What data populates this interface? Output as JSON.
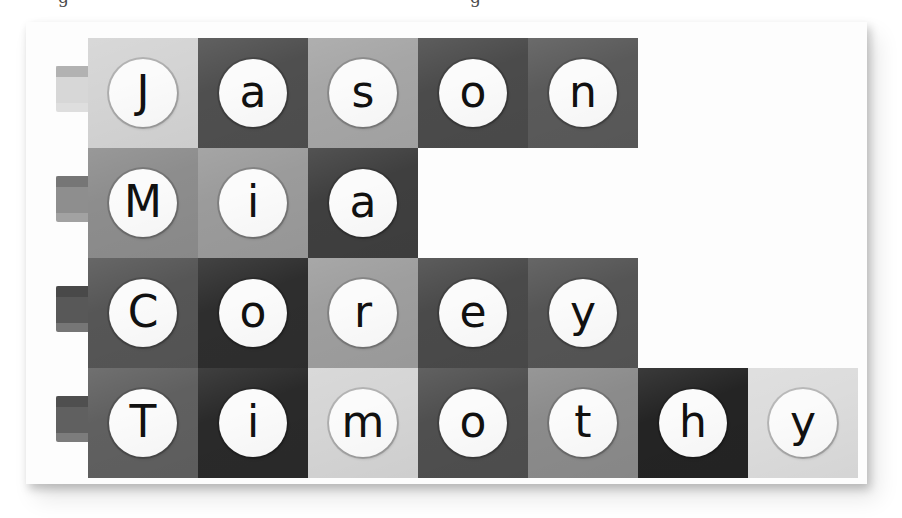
{
  "figure": {
    "card_background": "#fdfdfd",
    "page_background": "#ffffff",
    "disc_color": "#fbfbfb",
    "glyph_color": "#111111",
    "tile_size": 110,
    "columns_max": 7
  },
  "page_fragments": [
    {
      "text": "g",
      "left": 58
    },
    {
      "text": "g",
      "left": 470
    }
  ],
  "rows": [
    {
      "name": "Jason",
      "peg_color": "#d7d7d7",
      "tiles": [
        {
          "letter": "J",
          "color": "#d4d4d4"
        },
        {
          "letter": "a",
          "color": "#4f4f4f"
        },
        {
          "letter": "s",
          "color": "#a6a6a6"
        },
        {
          "letter": "o",
          "color": "#4b4b4b"
        },
        {
          "letter": "n",
          "color": "#5a5a5a"
        }
      ]
    },
    {
      "name": "Mia",
      "peg_color": "#8e8e8e",
      "tiles": [
        {
          "letter": "M",
          "color": "#8d8d8d"
        },
        {
          "letter": "i",
          "color": "#9b9b9b"
        },
        {
          "letter": "a",
          "color": "#3f3f3f"
        }
      ]
    },
    {
      "name": "Corey",
      "peg_color": "#585858",
      "tiles": [
        {
          "letter": "C",
          "color": "#565656"
        },
        {
          "letter": "o",
          "color": "#2e2e2e"
        },
        {
          "letter": "r",
          "color": "#9e9e9e"
        },
        {
          "letter": "e",
          "color": "#4a4a4a"
        },
        {
          "letter": "y",
          "color": "#555555"
        }
      ]
    },
    {
      "name": "Timothy",
      "peg_color": "#606060",
      "tiles": [
        {
          "letter": "T",
          "color": "#606060"
        },
        {
          "letter": "i",
          "color": "#2a2a2a"
        },
        {
          "letter": "m",
          "color": "#d5d5d5"
        },
        {
          "letter": "o",
          "color": "#4f4f4f"
        },
        {
          "letter": "t",
          "color": "#8b8b8b"
        },
        {
          "letter": "h",
          "color": "#242424"
        },
        {
          "letter": "y",
          "color": "#dcdcdc"
        }
      ]
    }
  ]
}
